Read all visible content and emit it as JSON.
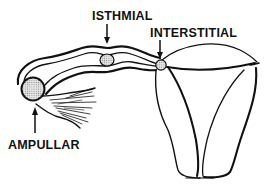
{
  "figure": {
    "labels": {
      "isthmial": "ISTHMIAL",
      "interstitial": "INTERSTITIAL",
      "ampullar": "AMPULLAR"
    },
    "colors": {
      "ink": "#111111",
      "background": "#ffffff",
      "stipple": "#b8b8b8"
    },
    "icons": {
      "isthmial_arrow": "arrow-down",
      "interstitial_arrow": "arrow-down",
      "ampullar_arrow": "arrow-up"
    }
  }
}
